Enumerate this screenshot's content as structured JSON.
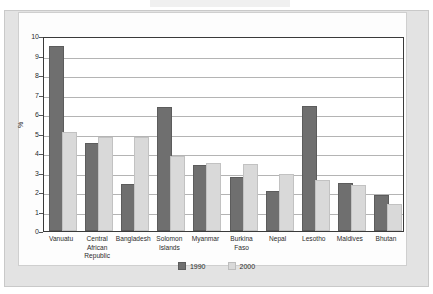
{
  "chart_data": {
    "type": "bar",
    "title": "",
    "xlabel": "",
    "ylabel": "%",
    "ylim": [
      0,
      10
    ],
    "yticks": [
      "0",
      "1",
      "2",
      "3",
      "4",
      "5",
      "6",
      "7",
      "8",
      "9",
      "10"
    ],
    "grid": true,
    "legend_position": "bottom",
    "categories": [
      "Vanuatu",
      "Central African Republic",
      "Bangladesh",
      "Solomon Islands",
      "Myanmar",
      "Burkina Faso",
      "Nepal",
      "Lesotho",
      "Maldives",
      "Bhutan"
    ],
    "category_lines": [
      [
        "Vanuatu"
      ],
      [
        "Central",
        "African",
        "Republic"
      ],
      [
        "Bangladesh"
      ],
      [
        "Solomon",
        "Islands"
      ],
      [
        "Myanmar"
      ],
      [
        "Burkina",
        "Faso"
      ],
      [
        "Nepal"
      ],
      [
        "Lesotho"
      ],
      [
        "Maldives"
      ],
      [
        "Bhutan"
      ]
    ],
    "series": [
      {
        "name": "1990",
        "color": "#6f6f6f",
        "values": [
          9.4,
          4.4,
          2.3,
          6.25,
          3.3,
          2.65,
          1.95,
          6.3,
          2.35,
          1.75
        ]
      },
      {
        "name": "2000",
        "color": "#d9d9d9",
        "values": [
          5.0,
          4.7,
          4.7,
          3.75,
          3.4,
          3.35,
          2.8,
          2.5,
          2.25,
          1.3
        ]
      }
    ]
  },
  "legend": {
    "items": [
      {
        "label": "1990"
      },
      {
        "label": "2000"
      }
    ]
  },
  "colors": {
    "series_1990": "#6f6f6f",
    "series_2000": "#d9d9d9",
    "axis": "#3a3a3a",
    "gridline": "#b4b4b4",
    "page_margin": "#e3e3e3",
    "panel": "#fdfdfd"
  }
}
